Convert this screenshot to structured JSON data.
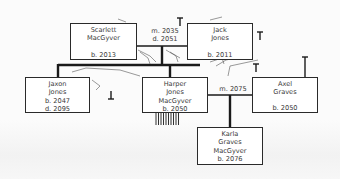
{
  "diagram": {
    "type": "family-tree",
    "colors": {
      "line": "#1a1a1a",
      "box_border": "#2a2a2a",
      "text": "#3a3a3a",
      "background": "#fbfbfb"
    },
    "people": [
      {
        "id": "scarlett",
        "name_line1": "Scarlett",
        "name_line2": "MacGyver",
        "name_line3": "",
        "born": "b. 2013",
        "died": ""
      },
      {
        "id": "jack",
        "name_line1": "Jack",
        "name_line2": "Jones",
        "name_line3": "",
        "born": "b. 2011",
        "died": ""
      },
      {
        "id": "jaxon",
        "name_line1": "Jaxon",
        "name_line2": "Jones",
        "name_line3": "",
        "born": "b. 2047",
        "died": "d. 2095"
      },
      {
        "id": "harper",
        "name_line1": "Harper",
        "name_line2": "Jones",
        "name_line3": "MacGyver",
        "born": "b. 2050",
        "died": ""
      },
      {
        "id": "axel",
        "name_line1": "Axel",
        "name_line2": "Graves",
        "name_line3": "",
        "born": "b. 2050",
        "died": ""
      },
      {
        "id": "karla",
        "name_line1": "Karla",
        "name_line2": "Graves",
        "name_line3": "MacGyver",
        "born": "b. 2076",
        "died": ""
      }
    ],
    "unions": [
      {
        "partners": [
          "scarlett",
          "jack"
        ],
        "married": "m. 2035",
        "divorced": "d. 2051",
        "children": [
          "jaxon",
          "harper"
        ]
      },
      {
        "partners": [
          "harper",
          "axel"
        ],
        "married": "m. 2075",
        "divorced": "",
        "children": [
          "karla"
        ]
      }
    ]
  }
}
